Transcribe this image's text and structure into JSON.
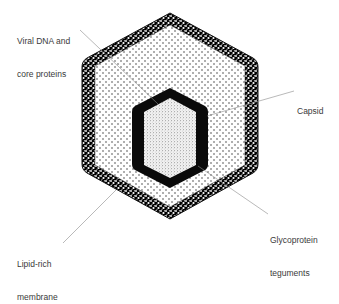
{
  "figure": {
    "colors": {
      "ink": "#111111",
      "leader": "#8a8a8a",
      "text": "#3a3a3a",
      "background": "#ffffff"
    }
  },
  "labels": {
    "viral_dna": {
      "line1": "Viral DNA and",
      "line2": "core proteins"
    },
    "capsid": {
      "text": "Capsid"
    },
    "glycoprotein": {
      "line1": "Glycoprotein",
      "line2": "teguments"
    },
    "membrane": {
      "line1": "Lipid-rich",
      "line2": "membrane"
    }
  }
}
